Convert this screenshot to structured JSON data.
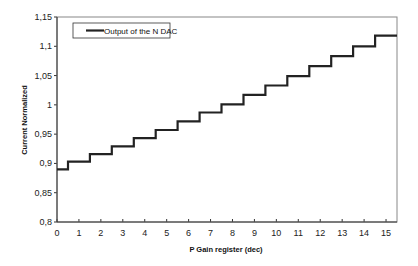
{
  "chart_data": {
    "type": "line",
    "style": "step",
    "title": "",
    "xlabel": "P Gain register (dec)",
    "ylabel": "Current Normalized",
    "x": [
      0,
      1,
      2,
      3,
      4,
      5,
      6,
      7,
      8,
      9,
      10,
      11,
      12,
      13,
      14,
      15
    ],
    "series": [
      {
        "name": "Output of the N DAC",
        "color": "#222222",
        "values": [
          0.89,
          0.903,
          0.916,
          0.929,
          0.943,
          0.957,
          0.972,
          0.987,
          1.001,
          1.017,
          1.033,
          1.049,
          1.066,
          1.083,
          1.1,
          1.118
        ]
      }
    ],
    "xlim": [
      0,
      15.5
    ],
    "ylim": [
      0.8,
      1.15
    ],
    "x_ticks": [
      "0",
      "1",
      "2",
      "3",
      "4",
      "5",
      "6",
      "7",
      "8",
      "9",
      "10",
      "11",
      "12",
      "13",
      "14",
      "15"
    ],
    "y_ticks": [
      "0,8",
      "0,85",
      "0,9",
      "0,95",
      "1",
      "1,05",
      "1,1",
      "1,15"
    ],
    "y_tick_values": [
      0.8,
      0.85,
      0.9,
      0.95,
      1.0,
      1.05,
      1.1,
      1.15
    ],
    "grid": false,
    "legend_position": "top-left"
  }
}
